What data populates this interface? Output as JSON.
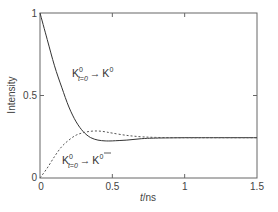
{
  "chart_data": {
    "type": "line",
    "title": "",
    "xlabel": "t/ns",
    "ylabel": "Intensity",
    "xlim": [
      0,
      1.5
    ],
    "ylim": [
      0,
      1
    ],
    "grid": false,
    "legend": "none (inline curve annotations)",
    "x_ticks": [
      {
        "value": 0,
        "label": "0"
      },
      {
        "value": 0.5,
        "label": "0.5"
      },
      {
        "value": 1,
        "label": "1"
      },
      {
        "value": 1.5,
        "label": "1.5"
      }
    ],
    "y_ticks": [
      {
        "value": 0,
        "label": "0"
      },
      {
        "value": 0.5,
        "label": "0.5"
      },
      {
        "value": 1,
        "label": "1"
      }
    ],
    "x": [
      0,
      0.05,
      0.1,
      0.15,
      0.2,
      0.25,
      0.3,
      0.35,
      0.4,
      0.45,
      0.5,
      0.6,
      0.7,
      0.8,
      1.0,
      1.2,
      1.5
    ],
    "series": [
      {
        "name": "K0(t=0) -> K0",
        "style": "solid",
        "color": "#333333",
        "values": [
          1.0,
          0.84,
          0.68,
          0.55,
          0.43,
          0.34,
          0.28,
          0.245,
          0.23,
          0.225,
          0.225,
          0.23,
          0.238,
          0.242,
          0.244,
          0.244,
          0.244
        ]
      },
      {
        "name": "K0(t=0) -> K0bar",
        "style": "dashed",
        "color": "#555555",
        "values": [
          0.0,
          0.06,
          0.13,
          0.19,
          0.23,
          0.26,
          0.275,
          0.283,
          0.285,
          0.28,
          0.272,
          0.258,
          0.25,
          0.246,
          0.244,
          0.244,
          0.244
        ]
      }
    ],
    "annotations": [
      {
        "text": "K0 t=0 → K0",
        "base": "K",
        "sup": "0",
        "sub": "t=0",
        "arrow": "→",
        "target_base": "K",
        "target_sup": "0",
        "target_bar": false,
        "x": 0.22,
        "y": 0.63
      },
      {
        "text": "K0 t=0 → K̄0",
        "base": "K",
        "sup": "0",
        "sub": "t=0",
        "arrow": "→",
        "target_base": "K",
        "target_sup": "0",
        "target_bar": true,
        "x": 0.22,
        "y": 0.12
      }
    ]
  },
  "labels": {
    "x_axis": "t/ns",
    "x_axis_italic_part": "t",
    "x_axis_rest": "/ns",
    "y_axis": "Intensity",
    "anno1": {
      "K": "K",
      "sup": "0",
      "sub": "t=0",
      "arrow": "→",
      "K2": "K",
      "sup2": "0"
    },
    "anno2": {
      "K": "K",
      "sup": "0",
      "sub": "t=0",
      "arrow": "→",
      "K2": "K",
      "sup2": "0"
    }
  }
}
